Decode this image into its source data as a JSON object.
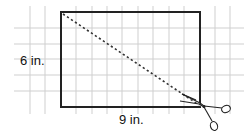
{
  "diagram": {
    "labels": {
      "height": "6 in.",
      "width": "9 in."
    },
    "rectangle": {
      "x": 61,
      "y": 12,
      "width": 139,
      "height": 95,
      "stroke": "#222222"
    },
    "grid": {
      "color": "#cfcfcf",
      "vertical_x": [
        30,
        45,
        76,
        92,
        107,
        122,
        138,
        153,
        169,
        184,
        215,
        230
      ],
      "horizontal_y": [
        28,
        44,
        59,
        75,
        91
      ],
      "extent": {
        "x1": 14,
        "x2": 244,
        "y1": 6,
        "y2": 114
      }
    },
    "cut_line": {
      "x1": 63,
      "y1": 14,
      "x2": 199,
      "y2": 105,
      "style": "dotted",
      "color": "#333333"
    },
    "scissors_icon": {
      "x": 200,
      "y": 108
    }
  }
}
